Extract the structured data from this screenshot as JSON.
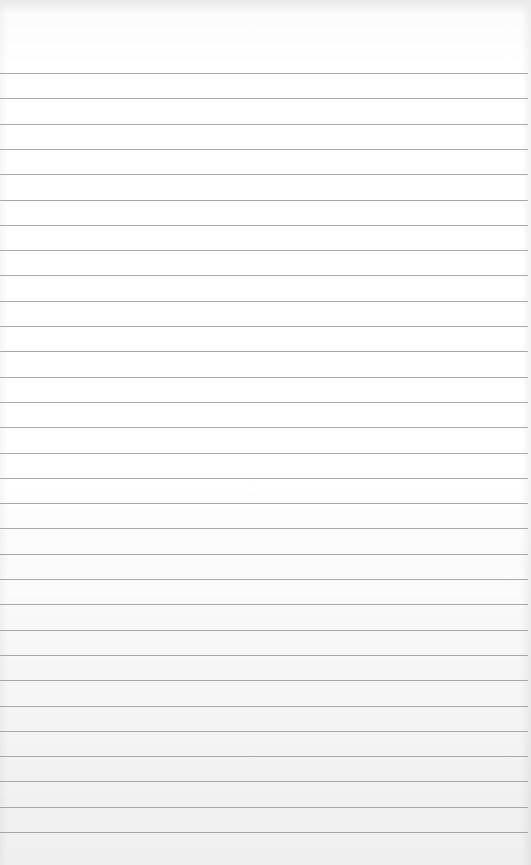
{
  "page": {
    "type": "ruled-notebook-paper",
    "background_color": "#ffffff",
    "rule_color": "#9a9a9a",
    "first_rule_y": 73,
    "rule_spacing_px": 25.3,
    "rule_count": 31,
    "text": ""
  }
}
